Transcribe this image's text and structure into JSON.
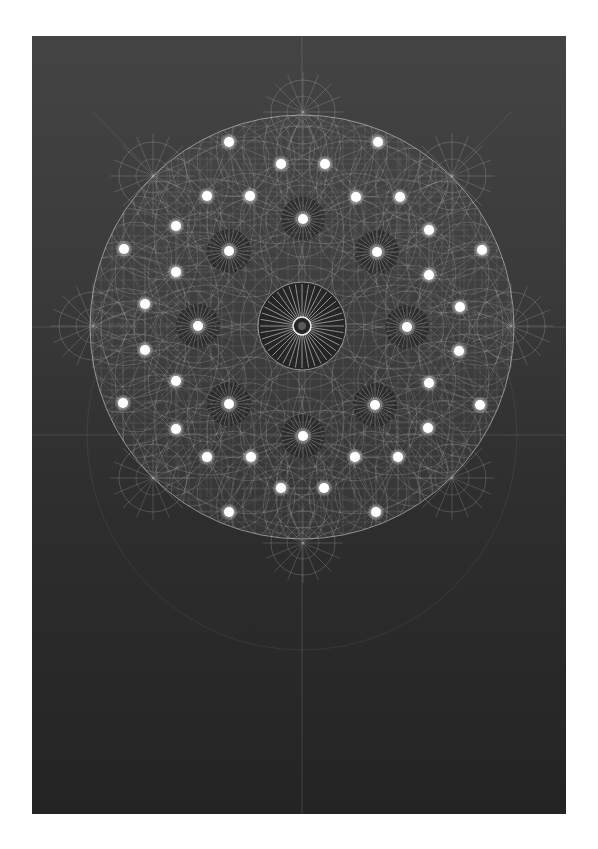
{
  "artwork": {
    "title": "Geometric mandala drawing on dark paper",
    "colors": {
      "page": "#ffffff",
      "panel_top": "#444444",
      "panel_bottom": "#242424",
      "line": "#d8d8d8",
      "dot": "#ffffff"
    },
    "panel": {
      "x": 32,
      "y": 36,
      "width": 534,
      "height": 778
    },
    "disk": {
      "cx": 302,
      "cy": 327,
      "r": 212
    },
    "center_rosette": {
      "cx": 302,
      "cy": 326,
      "r_outer": 44,
      "rays": 40
    },
    "guides": {
      "vertical_x": 302,
      "horizontal_y": [
        327,
        435
      ],
      "outer_circle": {
        "cx": 302,
        "cy": 435,
        "r": 215
      }
    },
    "satellite_compasses": [
      {
        "cx": 303,
        "cy": 112,
        "r": 32
      },
      {
        "cx": 153,
        "cy": 176,
        "r": 34
      },
      {
        "cx": 452,
        "cy": 176,
        "r": 34
      },
      {
        "cx": 93,
        "cy": 326,
        "r": 34
      },
      {
        "cx": 511,
        "cy": 326,
        "r": 34
      },
      {
        "cx": 153,
        "cy": 478,
        "r": 34
      },
      {
        "cx": 452,
        "cy": 478,
        "r": 34
      },
      {
        "cx": 303,
        "cy": 543,
        "r": 32
      }
    ],
    "star_dots": [
      [
        303,
        219
      ],
      [
        229,
        251
      ],
      [
        377,
        252
      ],
      [
        198,
        326
      ],
      [
        407,
        327
      ],
      [
        229,
        404
      ],
      [
        375,
        405
      ],
      [
        303,
        436
      ]
    ],
    "dots": [
      [
        229,
        142
      ],
      [
        378,
        142
      ],
      [
        281,
        164
      ],
      [
        325,
        164
      ],
      [
        207,
        196
      ],
      [
        250,
        196
      ],
      [
        356,
        197
      ],
      [
        400,
        197
      ],
      [
        176,
        226
      ],
      [
        429,
        230
      ],
      [
        124,
        249
      ],
      [
        482,
        250
      ],
      [
        176,
        272
      ],
      [
        429,
        275
      ],
      [
        145,
        304
      ],
      [
        460,
        307
      ],
      [
        145,
        350
      ],
      [
        459,
        351
      ],
      [
        176,
        381
      ],
      [
        429,
        383
      ],
      [
        123,
        403
      ],
      [
        480,
        405
      ],
      [
        176,
        429
      ],
      [
        428,
        428
      ],
      [
        207,
        457
      ],
      [
        251,
        457
      ],
      [
        355,
        457
      ],
      [
        398,
        457
      ],
      [
        281,
        488
      ],
      [
        324,
        488
      ],
      [
        229,
        512
      ],
      [
        376,
        512
      ]
    ]
  }
}
